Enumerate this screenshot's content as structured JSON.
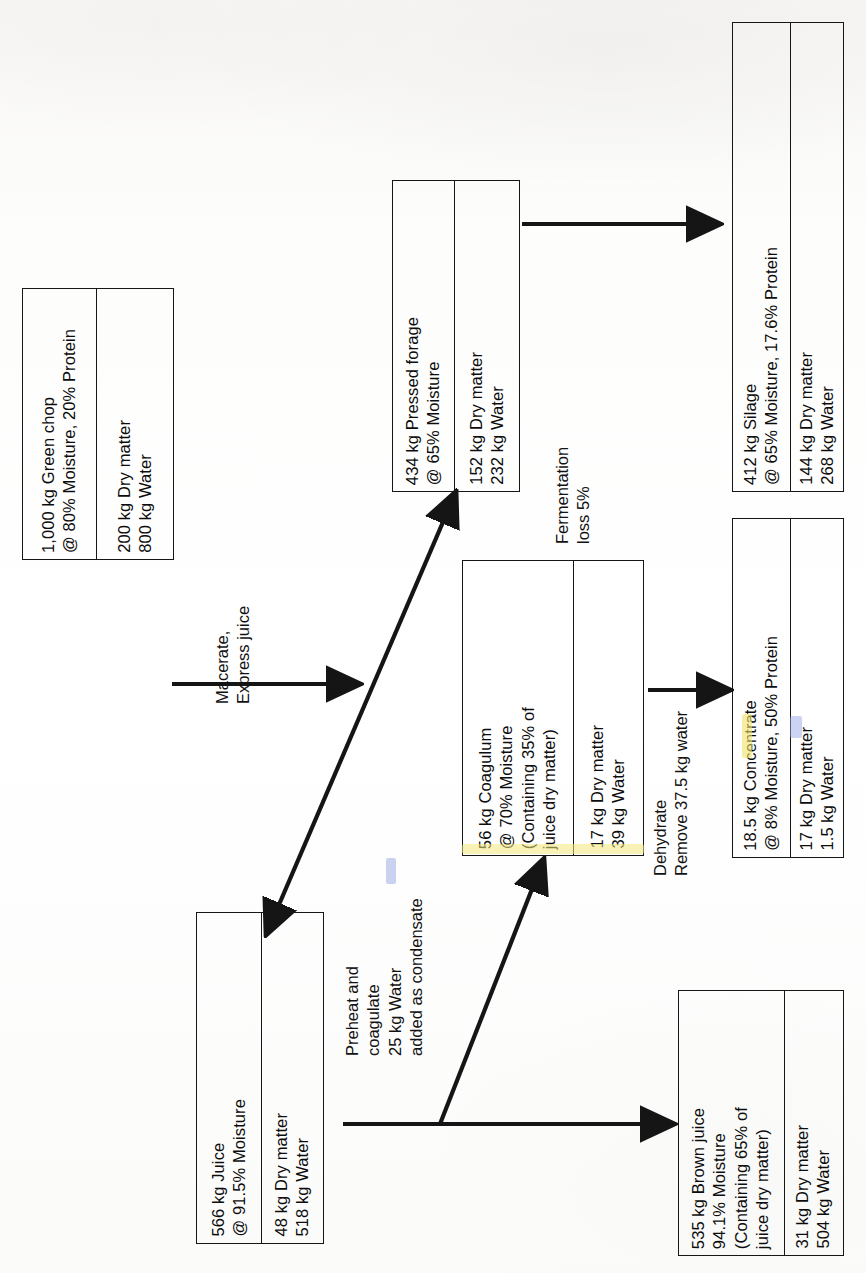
{
  "diagram": {
    "orientation": "rotated-90-ccw",
    "nodes": [
      {
        "id": "green-chop",
        "name": "Green chop",
        "left_cell": "1,000 kg Green chop\n@ 80% Moisture, 20% Protein",
        "right_cell": "200 kg Dry matter\n800 kg Water"
      },
      {
        "id": "pressed-forage",
        "name": "Pressed forage",
        "left_cell": "434 kg Pressed forage\n@ 65% Moisture",
        "right_cell": "152 kg Dry matter\n232 kg Water"
      },
      {
        "id": "silage",
        "name": "Silage",
        "left_cell": "412 kg Silage\n@ 65% Moisture, 17.6% Protein",
        "right_cell": "144 kg Dry matter\n268 kg Water"
      },
      {
        "id": "juice",
        "name": "Juice",
        "left_cell": "566 kg Juice\n@ 91.5% Moisture",
        "right_cell": "48 kg Dry matter\n518 kg Water"
      },
      {
        "id": "coagulum",
        "name": "Coagulum",
        "left_cell": "56 kg Coagulum\n@ 70% Moisture\n(Containing 35% of\njuice dry matter)",
        "right_cell": "17 kg Dry matter\n39 kg Water"
      },
      {
        "id": "concentrate",
        "name": "Concentrate",
        "left_cell": "18.5 kg Concentrate\n@ 8% Moisture, 50% Protein",
        "right_cell": "17 kg Dry matter\n1.5 kg Water"
      },
      {
        "id": "brown-juice",
        "name": "Brown juice",
        "left_cell": "535 kg Brown juice\n94.1% Moisture\n(Containing 65% of\njuice dry matter)",
        "right_cell": "31 kg Dry matter\n504 kg Water"
      }
    ],
    "process_labels": [
      {
        "id": "macerate",
        "text": "Macerate,\nExpress juice"
      },
      {
        "id": "fermentation",
        "text": "Fermentation\nloss 5%"
      },
      {
        "id": "preheat",
        "text": "Preheat and\ncoagulate\n25 kg Water\nadded as condensate"
      },
      {
        "id": "dehydrate",
        "text": "Dehydrate\nRemove 37.5 kg water"
      }
    ],
    "colors": {
      "ink": "#151515",
      "paper": "#fbfbfa",
      "highlight": "#f2e36a"
    }
  }
}
